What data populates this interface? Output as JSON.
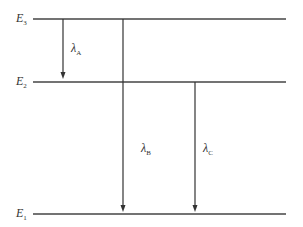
{
  "diagram": {
    "title": "",
    "levels": [
      {
        "id": "E3",
        "label": "E",
        "sub": "3",
        "y": 19
      },
      {
        "id": "E2",
        "label": "E",
        "sub": "2",
        "y": 82
      },
      {
        "id": "E1",
        "label": "E",
        "sub": "1",
        "y": 214
      }
    ],
    "transitions": [
      {
        "id": "A",
        "label": "λ",
        "sub": "A",
        "from": "E3",
        "to": "E2",
        "x": 63
      },
      {
        "id": "B",
        "label": "λ",
        "sub": "B",
        "from": "E3",
        "to": "E1",
        "x": 123
      },
      {
        "id": "C",
        "label": "λ",
        "sub": "C",
        "from": "E2",
        "to": "E1",
        "x": 195
      }
    ],
    "line_color": "#444444"
  }
}
